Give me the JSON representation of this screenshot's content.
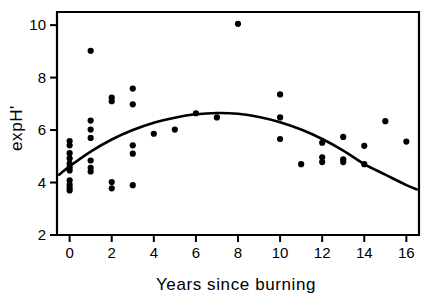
{
  "chart_data": {
    "type": "scatter",
    "title": "",
    "xlabel": "Years since burning",
    "ylabel": "expH'",
    "xlim": [
      -0.6,
      16.6
    ],
    "ylim": [
      2,
      10.5
    ],
    "xticks": [
      0,
      2,
      4,
      6,
      8,
      10,
      12,
      14,
      16
    ],
    "xtick_labels": [
      "0",
      "2",
      "4",
      "6",
      "8",
      "10",
      "12",
      "14",
      "16"
    ],
    "yticks": [
      2,
      4,
      6,
      8,
      10
    ],
    "ytick_labels": [
      "2",
      "4",
      "6",
      "8",
      "10"
    ],
    "grid": false,
    "legend": null,
    "marker_color": "#000000",
    "curve_color": "#000000",
    "frame_color": "#000000",
    "background": "#ffffff",
    "series": [
      {
        "name": "observations",
        "type": "scatter",
        "points": [
          [
            0,
            5.58
          ],
          [
            0,
            5.42
          ],
          [
            0,
            5.12
          ],
          [
            0,
            4.92
          ],
          [
            0,
            4.72
          ],
          [
            0,
            4.58
          ],
          [
            0,
            4.46
          ],
          [
            0,
            4.08
          ],
          [
            0,
            3.92
          ],
          [
            0,
            3.8
          ],
          [
            0,
            3.7
          ],
          [
            1,
            9.02
          ],
          [
            1,
            6.36
          ],
          [
            1,
            6.02
          ],
          [
            1,
            5.7
          ],
          [
            1,
            4.84
          ],
          [
            1,
            4.56
          ],
          [
            1,
            4.42
          ],
          [
            2,
            7.24
          ],
          [
            2,
            7.1
          ],
          [
            2,
            4.02
          ],
          [
            2,
            3.78
          ],
          [
            3,
            7.58
          ],
          [
            3,
            6.98
          ],
          [
            3,
            5.42
          ],
          [
            3,
            5.1
          ],
          [
            3,
            3.9
          ],
          [
            4,
            5.86
          ],
          [
            5,
            6.02
          ],
          [
            6,
            6.64
          ],
          [
            7,
            6.48
          ],
          [
            8,
            10.05
          ],
          [
            10,
            7.36
          ],
          [
            10,
            6.48
          ],
          [
            10,
            5.66
          ],
          [
            11,
            4.7
          ],
          [
            12,
            5.52
          ],
          [
            12,
            4.96
          ],
          [
            12,
            4.78
          ],
          [
            13,
            5.74
          ],
          [
            13,
            4.88
          ],
          [
            13,
            4.78
          ],
          [
            14,
            5.4
          ],
          [
            14,
            4.7
          ],
          [
            15,
            6.34
          ],
          [
            16,
            5.56
          ]
        ]
      },
      {
        "name": "quadratic-fit",
        "type": "line",
        "equation_points": [
          [
            -0.5,
            4.3
          ],
          [
            0,
            4.62
          ],
          [
            1,
            5.18
          ],
          [
            2,
            5.64
          ],
          [
            3,
            6.0
          ],
          [
            4,
            6.28
          ],
          [
            5,
            6.47
          ],
          [
            6,
            6.6
          ],
          [
            7,
            6.65
          ],
          [
            8,
            6.62
          ],
          [
            9,
            6.5
          ],
          [
            10,
            6.3
          ],
          [
            11,
            6.02
          ],
          [
            12,
            5.66
          ],
          [
            13,
            5.22
          ],
          [
            14,
            4.7
          ],
          [
            15,
            4.3
          ],
          [
            16,
            3.9
          ],
          [
            16.5,
            3.74
          ]
        ]
      }
    ]
  },
  "figure": {
    "y_axis_label": "expH'",
    "x_axis_label": "Years  since  burning"
  }
}
